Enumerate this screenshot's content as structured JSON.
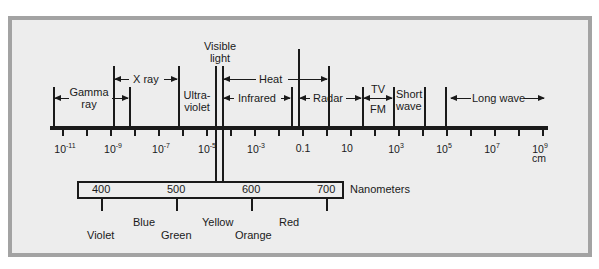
{
  "diagram": {
    "axis": {
      "unit": "cm",
      "ticks": [
        {
          "base": "10",
          "exp": "-11"
        },
        {
          "base": "10",
          "exp": "-9"
        },
        {
          "base": "10",
          "exp": "-7"
        },
        {
          "base": "10",
          "exp": "-5"
        },
        {
          "base": "10",
          "exp": "-3"
        },
        {
          "base": "0.1",
          "exp": ""
        },
        {
          "base": "10",
          "exp": ""
        },
        {
          "base": "10",
          "exp": "3"
        },
        {
          "base": "10",
          "exp": "5"
        },
        {
          "base": "10",
          "exp": "7"
        },
        {
          "base": "10",
          "exp": "9"
        }
      ]
    },
    "regions": {
      "gamma": {
        "line1": "Gamma",
        "line2": "ray"
      },
      "xray": "X ray",
      "ultraviolet": {
        "line1": "Ultra-",
        "line2": "violet"
      },
      "visible": {
        "line1": "Visible",
        "line2": "light"
      },
      "heat": "Heat",
      "infrared": "Infrared",
      "radar": "Radar",
      "tv": "TV",
      "fm": "FM",
      "shortwave": {
        "line1": "Short",
        "line2": "wave"
      },
      "longwave": "Long wave"
    },
    "nanometers": {
      "label": "Nanometers",
      "ticks": [
        "400",
        "500",
        "600",
        "700"
      ],
      "colors": [
        {
          "name": "Violet",
          "row": "lower"
        },
        {
          "name": "Blue",
          "row": "upper"
        },
        {
          "name": "Green",
          "row": "lower"
        },
        {
          "name": "Yellow",
          "row": "upper"
        },
        {
          "name": "Orange",
          "row": "lower"
        },
        {
          "name": "Red",
          "row": "upper"
        }
      ]
    }
  }
}
